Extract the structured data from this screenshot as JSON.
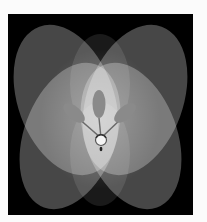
{
  "artwork": {
    "description": "Abstract composition of four overlapping translucent tilted ellipses forming a flower shape on a black square, with a central three-leaf and ball emblem",
    "background_color": "#000000",
    "page_color": "#fbfbfb",
    "ellipses": [
      {
        "cx": 58,
        "cy": 92,
        "rx": 50,
        "ry": 80,
        "rotate": -22
      },
      {
        "cx": 126,
        "cy": 92,
        "rx": 50,
        "ry": 80,
        "rotate": 22
      },
      {
        "cx": 58,
        "cy": 118,
        "rx": 48,
        "ry": 80,
        "rotate": 22
      },
      {
        "cx": 126,
        "cy": 118,
        "rx": 48,
        "ry": 80,
        "rotate": -22
      }
    ],
    "emblem": {
      "leaves": 3,
      "leaf_color": "#8a8a8a",
      "ball_color": "#f4f4f4"
    }
  }
}
